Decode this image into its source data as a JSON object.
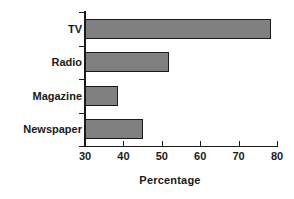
{
  "chart_data": {
    "type": "bar",
    "orientation": "horizontal",
    "title": "",
    "subtitle": "",
    "categories": [
      "TV",
      "Radio",
      "Magazine",
      "Newspaper"
    ],
    "values": [
      78.5,
      52,
      38.5,
      45
    ],
    "xlabel": "Percentage",
    "ylabel": "",
    "xlim": [
      30,
      80
    ],
    "xticks": [
      30,
      40,
      50,
      60,
      70,
      80
    ],
    "xticklabels": [
      "30",
      "40",
      "50",
      "60",
      "70",
      "80"
    ],
    "grid": false,
    "legend": false,
    "legend_position": "none",
    "annotations": []
  },
  "style": {
    "bar_fill": "#808080",
    "bar_border": "#1a1a1a",
    "axis_color": "#1a1a1a",
    "background": "#ffffff",
    "text_color": "#1a1a1a"
  }
}
